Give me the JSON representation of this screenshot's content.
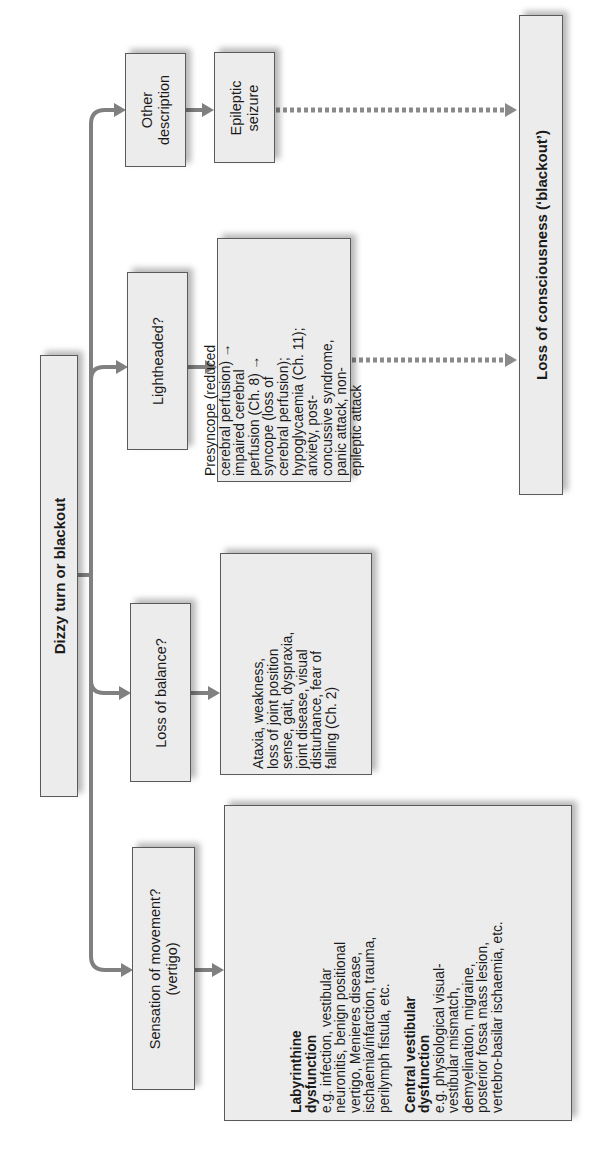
{
  "diagram": {
    "orientation": "rotated 90 degrees counter-clockwise",
    "root": {
      "label": "Dizzy turn or blackout"
    },
    "branches": [
      {
        "question": "Other description",
        "outcome": {
          "label": "Epileptic seizure"
        },
        "leads_to_blackout": true
      },
      {
        "question": "Lightheaded?",
        "outcome": {
          "text": "Presyncope (reduced cerebral perfusion) → impaired cerebral perfusion (Ch. 8) → syncope (loss of cerebral perfusion); hypoglycaemia (Ch. 11); anxiety, post-concussive syndrome, panic attack, non-epileptic attack"
        },
        "leads_to_blackout": true
      },
      {
        "question": "Loss of balance?",
        "outcome": {
          "text": "Ataxia, weakness, loss of joint position sense, gait, dyspraxia, joint disease, visual disturbance, fear of falling (Ch. 2)"
        },
        "leads_to_blackout": false
      },
      {
        "question": "Sensation of movement? (vertigo)",
        "outcome": {
          "sections": [
            {
              "heading": "Labyrinthine dysfunction",
              "text": "e.g. infection, vestibular neuronitis, benign positional vertigo, Menieres disease, ischaemia/infarction, trauma, perilymph fistula, etc."
            },
            {
              "heading": "Central vestibular dysfunction",
              "text": "e.g. physiological visual-vestibular mismatch, demyelination, migraine, posterior fossa mass lesion, vertebro-basilar ischaemia, etc."
            }
          ]
        },
        "leads_to_blackout": false
      }
    ],
    "terminal": {
      "label": "Loss of consciousness (‘blackout’)"
    }
  },
  "lines": {
    "other_1": "Other",
    "other_2": "description",
    "epileptic_1": "Epileptic",
    "epileptic_2": "seizure",
    "lightheaded": "Lightheaded?",
    "presyncope": [
      "Presyncope (reduced",
      "cerebral perfusion) →",
      "impaired cerebral",
      "perfusion (Ch. 8) →",
      "syncope (loss of",
      "cerebral perfusion);",
      "hypoglycaemia (Ch. 11);",
      "anxiety, post-",
      "concussive syndrome,",
      "panic attack, non-",
      "epileptic attack"
    ],
    "balance": "Loss of balance?",
    "ataxia": [
      "Ataxia, weakness,",
      "loss of joint position",
      "sense, gait, dyspraxia,",
      "joint disease, visual",
      "disturbance, fear of",
      "falling (Ch. 2)"
    ],
    "vertigo_1": "Sensation of movement?",
    "vertigo_2": "(vertigo)",
    "laby_head": [
      "Labyrinthine",
      "dysfunction"
    ],
    "laby_text": [
      "e.g. infection, vestibular",
      "neuronitis, benign positional",
      "vertigo, Menieres disease,",
      "ischaemia/infarction, trauma,",
      "perilymph fistula, etc."
    ],
    "central_head": [
      "Central vestibular",
      "dysfunction"
    ],
    "central_text": [
      "e.g. physiological visual-",
      "vestibular mismatch,",
      "demyelination, migraine,",
      "posterior fossa mass lesion,",
      "vertebro-basilar ischaemia, etc."
    ]
  },
  "colors": {
    "box_fill": "#ececec",
    "box_border": "#5a5a5a",
    "connector": "#808080",
    "dotted_connector": "#8a8a8a"
  }
}
